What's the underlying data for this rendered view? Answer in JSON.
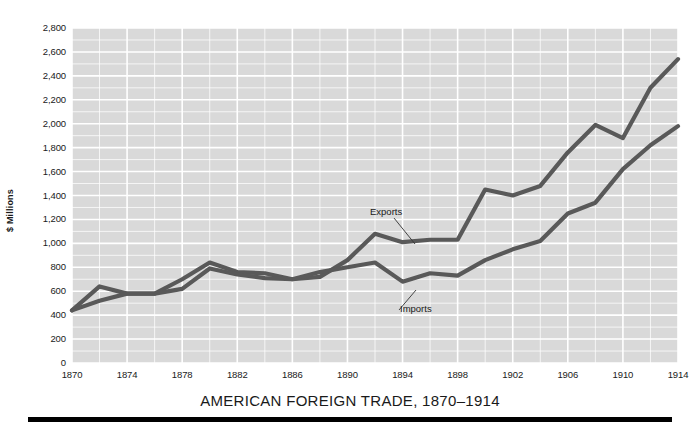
{
  "figure": {
    "title": "AMERICAN FOREIGN TRADE, 1870–1914",
    "y_axis_label": "$ Millions"
  },
  "labels": {
    "exports": "Exports",
    "imports": "Imports"
  },
  "colors": {
    "plot_background": "#d9d9d9",
    "gridline": "#ffffff",
    "line": "#595959",
    "text": "#1a1a1a",
    "rule": "#000000"
  },
  "chart_data": {
    "type": "line",
    "title": "AMERICAN FOREIGN TRADE, 1870–1914",
    "xlabel": "",
    "ylabel": "$ Millions",
    "xlim": [
      1870,
      1914
    ],
    "ylim": [
      0,
      2800
    ],
    "grid": true,
    "legend": "inline-annotations",
    "ytick_labels": [
      "0",
      "200",
      "400",
      "600",
      "800",
      "1,000",
      "1,200",
      "1,400",
      "1,600",
      "1,800",
      "2,000",
      "2,200",
      "2,400",
      "2,600",
      "2,800"
    ],
    "ytick_values": [
      0,
      200,
      400,
      600,
      800,
      1000,
      1200,
      1400,
      1600,
      1800,
      2000,
      2200,
      2400,
      2600,
      2800
    ],
    "xtick_labels": [
      "1870",
      "1874",
      "1878",
      "1882",
      "1886",
      "1890",
      "1894",
      "1898",
      "1902",
      "1906",
      "1910",
      "1914"
    ],
    "xtick_values": [
      1870,
      1874,
      1878,
      1882,
      1886,
      1890,
      1894,
      1898,
      1902,
      1906,
      1910,
      1914
    ],
    "minor_gridline_step_y": 100,
    "minor_gridline_step_x": 2,
    "x": [
      1870,
      1872,
      1874,
      1876,
      1878,
      1880,
      1882,
      1884,
      1886,
      1888,
      1890,
      1892,
      1894,
      1896,
      1898,
      1900,
      1902,
      1904,
      1906,
      1908,
      1910,
      1912,
      1914
    ],
    "series": [
      {
        "name": "Exports",
        "values": [
          440,
          640,
          580,
          580,
          700,
          840,
          760,
          750,
          700,
          720,
          860,
          1080,
          1010,
          1030,
          1030,
          1450,
          1400,
          1480,
          1760,
          1990,
          1880,
          2300,
          2540
        ]
      },
      {
        "name": "Imports",
        "values": [
          440,
          520,
          580,
          580,
          620,
          790,
          740,
          710,
          700,
          760,
          800,
          840,
          680,
          750,
          730,
          860,
          950,
          1020,
          1250,
          1340,
          1620,
          1820,
          1980
        ]
      }
    ]
  }
}
